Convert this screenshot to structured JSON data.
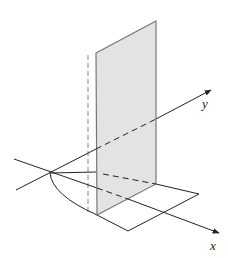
{
  "diagram": {
    "labels": {
      "x_axis": "x",
      "y_axis": "y"
    },
    "colors": {
      "plane_fill": "#e3e3e3",
      "plane_edge": "#777777",
      "line": "#222222"
    }
  }
}
